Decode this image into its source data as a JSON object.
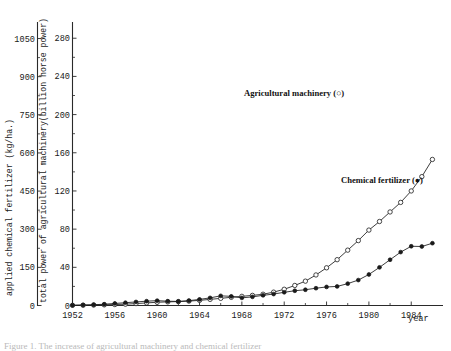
{
  "figure": {
    "caption": "Figure 1. The increase of agricultural machinery and chemical fertilizer"
  },
  "chart_data": {
    "type": "line",
    "title": "",
    "xlabel": "year",
    "xlim": [
      1952,
      1987
    ],
    "xticks": [
      1952,
      1956,
      1960,
      1964,
      1968,
      1972,
      1976,
      1980,
      1984
    ],
    "xticklabels": [
      "1952",
      "1956",
      "1960",
      "1964",
      "1968",
      "1972",
      "1976",
      "1980",
      "1984"
    ],
    "grid": false,
    "legend_position": "inside-right",
    "axes": [
      {
        "id": "left-outer",
        "label": "applied chemical fertilizer (kg/ha.)",
        "ticks": [
          0,
          150,
          300,
          450,
          600,
          750,
          900,
          1050
        ],
        "ticklabels": [
          "0",
          "150",
          "300",
          "450",
          "600",
          "750",
          "900",
          "1050"
        ],
        "ylim": [
          0,
          1115
        ]
      },
      {
        "id": "left-inner",
        "label": "total power of agricultural machinery(billion horse power)",
        "ticks": [
          0,
          40,
          80,
          120,
          160,
          200,
          240,
          280
        ],
        "ticklabels": [
          "0",
          "40",
          "80",
          "120",
          "160",
          "200",
          "240",
          "280"
        ],
        "ylim": [
          0,
          297
        ]
      }
    ],
    "series": [
      {
        "name": "Agricultural machinery",
        "marker": "open-circle",
        "legend_label": "Agricultural machinery (○)",
        "axis": "left-inner",
        "x": [
          1952,
          1953,
          1954,
          1955,
          1956,
          1957,
          1958,
          1959,
          1960,
          1961,
          1962,
          1963,
          1964,
          1965,
          1966,
          1967,
          1968,
          1969,
          1970,
          1971,
          1972,
          1973,
          1974,
          1975,
          1976,
          1977,
          1978,
          1979,
          1980,
          1981,
          1982,
          1983,
          1984,
          1985,
          1986
        ],
        "values": [
          0.2,
          0.3,
          0.5,
          0.7,
          1.0,
          1.4,
          2.0,
          2.7,
          3.4,
          3.8,
          4.1,
          4.6,
          5.4,
          6.4,
          7.5,
          8.6,
          9.6,
          10.6,
          11.8,
          14.0,
          17.0,
          21.0,
          25.5,
          32.0,
          39.5,
          48.0,
          58.0,
          68.0,
          79.0,
          88.0,
          98.0,
          108.0,
          120.0,
          135.0,
          153.0
        ]
      },
      {
        "name": "Chemical fertilizer",
        "marker": "filled-circle",
        "legend_label": "Chemical fertilizer (●)",
        "axis": "left-outer",
        "x": [
          1952,
          1953,
          1954,
          1955,
          1956,
          1957,
          1958,
          1959,
          1960,
          1961,
          1962,
          1963,
          1964,
          1965,
          1966,
          1967,
          1968,
          1969,
          1970,
          1971,
          1972,
          1973,
          1974,
          1975,
          1976,
          1977,
          1978,
          1979,
          1980,
          1981,
          1982,
          1983,
          1984,
          1985,
          1986
        ],
        "values": [
          1,
          2,
          3,
          5,
          8,
          11,
          14,
          17,
          19,
          17,
          16,
          19,
          24,
          30,
          38,
          36,
          30,
          34,
          40,
          45,
          52,
          58,
          62,
          68,
          73,
          75,
          86,
          100,
          122,
          150,
          180,
          210,
          233,
          232,
          245
        ]
      }
    ],
    "annotations": [
      {
        "text": "Agricultural machinery (○)",
        "x_px": 244,
        "y_px": 96
      },
      {
        "text": "Chemical fertilizer (●)",
        "x_px": 341,
        "y_px": 183
      }
    ]
  }
}
